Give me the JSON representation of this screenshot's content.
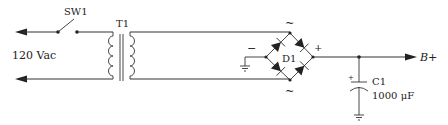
{
  "diagram": {
    "type": "circuit-schematic",
    "colors": {
      "line": "#333333",
      "text": "#222222",
      "background": "#ffffff"
    },
    "labels": {
      "switch": "SW1",
      "transformer": "T1",
      "input_voltage": "120 Vac",
      "bridge": "D1",
      "ac_top": "~",
      "ac_bottom": "~",
      "bridge_negative": "−",
      "bridge_positive": "+",
      "capacitor": "C1",
      "capacitor_value": "1000 μF",
      "capacitor_polarity": "+",
      "output": "B+"
    },
    "components": [
      {
        "ref": "SW1",
        "kind": "switch"
      },
      {
        "ref": "T1",
        "kind": "transformer"
      },
      {
        "ref": "D1",
        "kind": "bridge-rectifier"
      },
      {
        "ref": "C1",
        "kind": "electrolytic-capacitor",
        "value": "1000 μF"
      }
    ]
  }
}
